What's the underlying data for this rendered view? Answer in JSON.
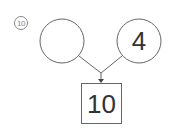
{
  "problem": {
    "number_label": "10",
    "left_circle_value": "",
    "right_circle_value": "4",
    "result_box_value": "10"
  },
  "colors": {
    "stroke": "#666666",
    "text": "#333333"
  }
}
